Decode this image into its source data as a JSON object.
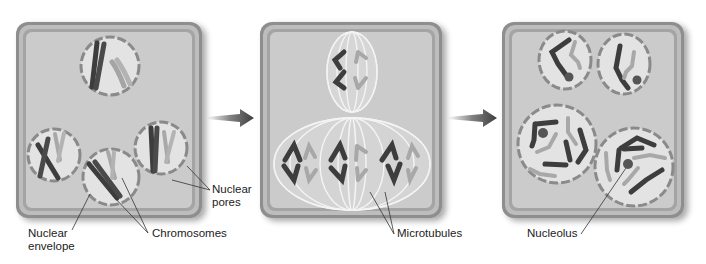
{
  "diagram": {
    "type": "cell-division-stages",
    "stages": [
      {
        "id": "stage-1",
        "description": "Multinucleate cell with nuclei containing chromosomes"
      },
      {
        "id": "stage-2",
        "description": "Synchronous mitosis with spindles"
      },
      {
        "id": "stage-3",
        "description": "Daughter nuclei with decondensing chromosomes and nucleoli"
      }
    ],
    "arrows": [
      {
        "from": "stage-1",
        "to": "stage-2"
      },
      {
        "from": "stage-2",
        "to": "stage-3"
      }
    ]
  },
  "labels": {
    "nuclear_pores": [
      "Nuclear",
      "pores"
    ],
    "nuclear_envelope": [
      "Nuclear",
      "envelope"
    ],
    "chromosomes": "Chromosomes",
    "microtubules": "Microtubules",
    "nucleolus": "Nucleolus"
  },
  "colors": {
    "cell_outer": "#8e8e8e",
    "cell_inner_border": "#a9a9a9",
    "cytoplasm": "#c9c9c9",
    "nucleus": "#e4e4e4",
    "envelope": "#8a8a8a",
    "chromosome_dark": "#3a3a3a",
    "chromosome_light": "#a8a8a8",
    "spindle": "#f4f4f4",
    "arrow": "#4a4a4a",
    "text": "#222222"
  }
}
